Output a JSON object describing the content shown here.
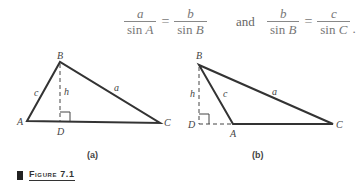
{
  "equations": {
    "eq1": {
      "left_num": "a",
      "left_den_fn": "sin ",
      "left_den_var": "A",
      "op": "=",
      "right_num": "b",
      "right_den_fn": "sin ",
      "right_den_var": "B"
    },
    "connector": "and",
    "eq2": {
      "left_num": "b",
      "left_den_fn": "sin ",
      "left_den_var": "B",
      "op": "=",
      "right_num": "c",
      "right_den_fn": "sin ",
      "right_den_var": "C",
      "trailing": "."
    }
  },
  "figure_a": {
    "vertices": {
      "A": "A",
      "B": "B",
      "C": "C",
      "D": "D"
    },
    "sides": {
      "a": "a",
      "c": "c",
      "h": "h"
    },
    "sublabel": "(a)"
  },
  "figure_b": {
    "vertices": {
      "A": "A",
      "B": "B",
      "C": "C",
      "D": "D"
    },
    "sides": {
      "a": "a",
      "c": "c",
      "h": "h"
    },
    "sublabel": "(b)"
  },
  "caption": "Figure 7.1",
  "colors": {
    "line": "#333333",
    "text": "#444444",
    "equation": "#777777"
  }
}
